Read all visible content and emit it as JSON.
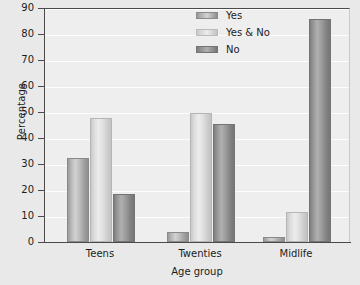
{
  "chart_data": {
    "type": "bar",
    "title": "",
    "xlabel": "Age group",
    "ylabel": "Percentage",
    "categories": [
      "Teens",
      "Twenties",
      "Midlife"
    ],
    "series": [
      {
        "name": "Yes",
        "values": [
          32.5,
          3.8,
          2.0
        ]
      },
      {
        "name": "Yes & No",
        "values": [
          47.8,
          49.8,
          11.6
        ]
      },
      {
        "name": "No",
        "values": [
          18.6,
          45.4,
          85.6
        ]
      }
    ],
    "ylim": [
      0,
      90
    ],
    "yticks": [
      0,
      10,
      20,
      30,
      40,
      50,
      60,
      70,
      80,
      90
    ],
    "ytick_labels": [
      "0",
      "10",
      "20",
      "30",
      "40",
      "50",
      "60",
      "70",
      "80",
      "90"
    ],
    "grid": "horizontal",
    "legend_position": "top-center",
    "colors": {
      "series_yes": "#b4b4b4",
      "series_yes_and_no": "#e0e0e0",
      "series_no": "#949494",
      "plot_background": "#eeeeee",
      "figure_background": "#e9e9e9",
      "gridline": "#fdfdfd",
      "axis": "#4a4a4a",
      "text": "#1c1c1c"
    }
  }
}
